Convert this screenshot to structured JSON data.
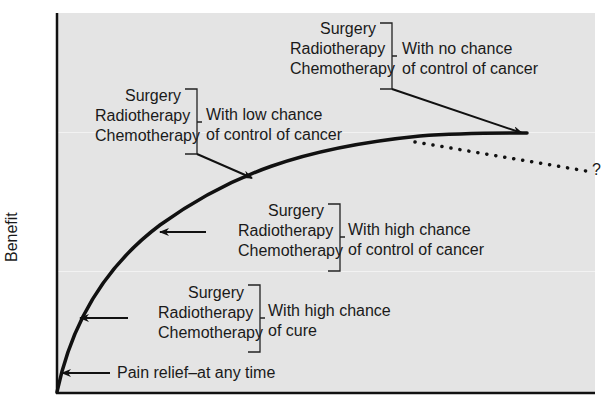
{
  "diagram": {
    "y_axis_label": "Benefit",
    "colors": {
      "plot_background": "#e4e4e4",
      "curve": "#111111",
      "text": "#1a1a1a"
    },
    "question_mark": "?",
    "annotations": [
      {
        "id": "no-chance",
        "treatments": [
          "Surgery",
          "Radiotherapy",
          "Chemotherapy"
        ],
        "description": [
          "With no chance",
          "of control of cancer"
        ]
      },
      {
        "id": "low-chance",
        "treatments": [
          "Surgery",
          "Radiotherapy",
          "Chemotherapy"
        ],
        "description": [
          "With low chance",
          "of control of cancer"
        ]
      },
      {
        "id": "high-control",
        "treatments": [
          "Surgery",
          "Radiotherapy",
          "Chemotherapy"
        ],
        "description": [
          "With high chance",
          "of control of cancer"
        ]
      },
      {
        "id": "high-cure",
        "treatments": [
          "Surgery",
          "Radiotherapy",
          "Chemotherapy"
        ],
        "description": [
          "With high chance",
          "of cure"
        ]
      }
    ],
    "pain_relief": "Pain relief–at any time"
  }
}
